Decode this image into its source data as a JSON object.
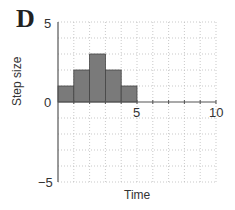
{
  "panel": {
    "letter": "D"
  },
  "chart_data": {
    "type": "bar",
    "title": "",
    "xlabel": "Time",
    "ylabel": "Step size",
    "xlim": [
      0,
      10
    ],
    "ylim": [
      -5,
      5
    ],
    "grid": true,
    "x_ticks": [
      0,
      5,
      10
    ],
    "y_ticks": [
      -5,
      0,
      5
    ],
    "x_tick_labels": [
      "5",
      "10"
    ],
    "y_tick_labels": [
      "5",
      "0",
      "−5"
    ],
    "bins": [
      {
        "x_start": 0,
        "x_end": 1,
        "value": 1
      },
      {
        "x_start": 1,
        "x_end": 2,
        "value": 2
      },
      {
        "x_start": 2,
        "x_end": 3,
        "value": 3
      },
      {
        "x_start": 3,
        "x_end": 4,
        "value": 2
      },
      {
        "x_start": 4,
        "x_end": 5,
        "value": 1
      }
    ],
    "categories": [
      "0-1",
      "1-2",
      "2-3",
      "3-4",
      "4-5"
    ],
    "values": [
      1,
      2,
      3,
      2,
      1
    ],
    "bar_color": "#7a7a7a"
  }
}
